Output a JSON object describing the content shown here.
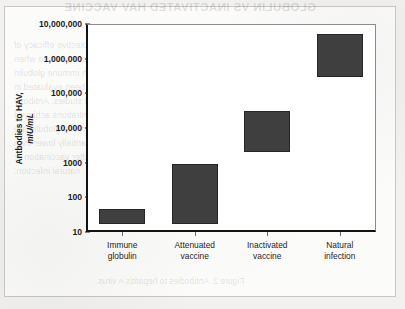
{
  "page": {
    "bleed_through": {
      "note": "faint mirrored show-through text from reverse side of the scanned page",
      "title": "GLOBULIN VS INACTIVATED HAV VACCINE",
      "lines": [
        "and protective efficacy of",
        "hepatitis A vaccine when",
        "given with immune globulin",
        "has been evaluated in",
        "several studies. Antibody",
        "concentrations achieved",
        "after immune globulin are",
        "substantially lower than",
        "those after vaccination or",
        "natural infection."
      ],
      "caption": "Figure 2. Antibodies to hepatitis A virus."
    }
  },
  "chart_data": {
    "type": "bar",
    "bar_style": "floating-range",
    "title": "",
    "xlabel": "",
    "ylabel": "Antbodies to HAV, mIU/mL",
    "ylabel_main": "Antbodies to HAV,",
    "ylabel_units": "mIU/mL",
    "yscale": "log",
    "ylim": [
      10,
      10000000
    ],
    "grid": false,
    "legend": null,
    "ytick_labels": [
      "10,000,000",
      "1,000,000",
      "100,000",
      "10,000",
      "1000",
      "100",
      "10"
    ],
    "ytick_values": [
      10000000,
      1000000,
      100000,
      10000,
      1000,
      100,
      10
    ],
    "categories": [
      "Immune globulin",
      "Attenuated vaccine",
      "Inactivated vaccine",
      "Natural infection"
    ],
    "category_lines": [
      [
        "Immune",
        "globulin"
      ],
      [
        "Attenuated",
        "vaccine"
      ],
      [
        "Inactivated",
        "vaccine"
      ],
      [
        "Natural",
        "infection"
      ]
    ],
    "series": [
      {
        "name": "Antibody titer range",
        "color": "#3f3f3f",
        "ranges": [
          {
            "category": "Immune globulin",
            "low": 17,
            "high": 45
          },
          {
            "category": "Attenuated vaccine",
            "low": 17,
            "high": 900
          },
          {
            "category": "Inactivated vaccine",
            "low": 2000,
            "high": 30000
          },
          {
            "category": "Natural infection",
            "low": 300000,
            "high": 5000000
          }
        ]
      }
    ]
  }
}
